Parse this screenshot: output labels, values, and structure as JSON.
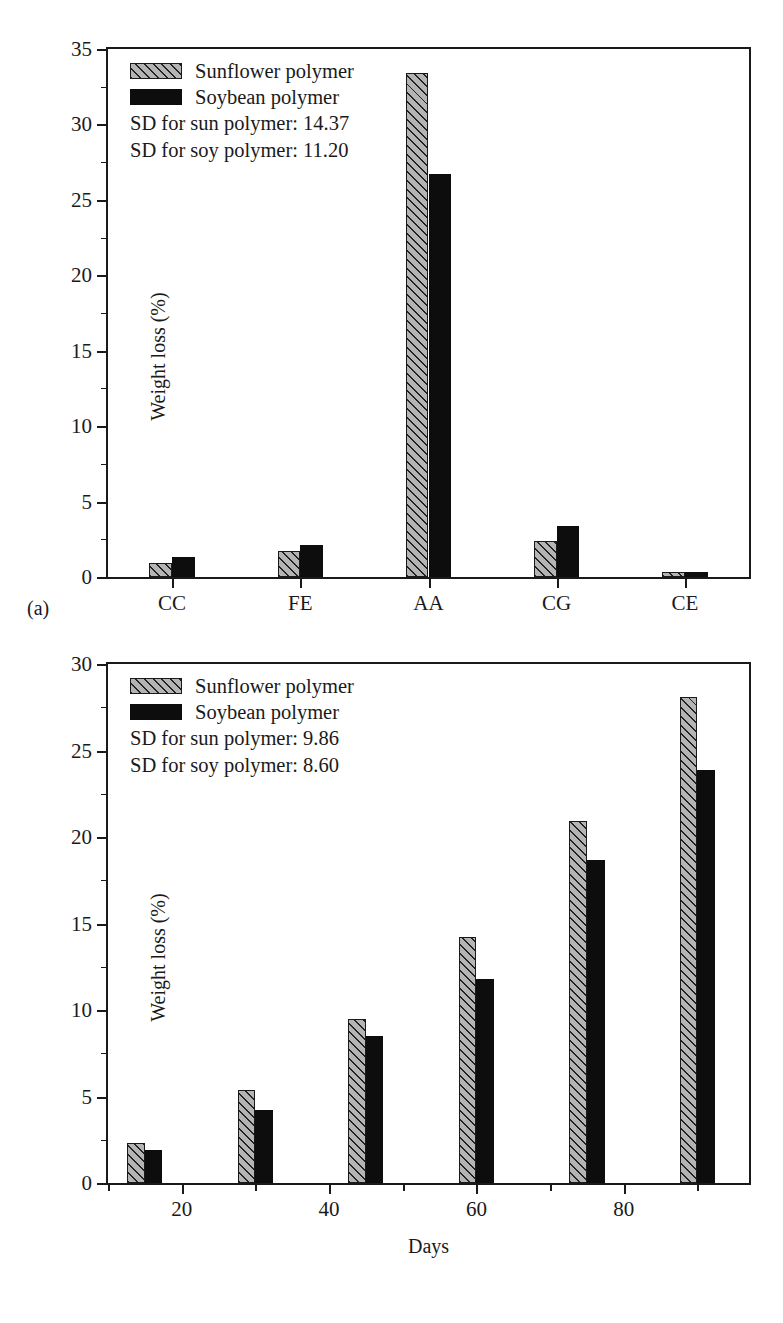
{
  "figure": {
    "panels": [
      {
        "caption": "(a)",
        "legend": {
          "series": [
            {
              "label": "Sunflower polymer",
              "pattern": "hatched-gray",
              "color": "#b4b4b4"
            },
            {
              "label": "Soybean polymer",
              "pattern": "solid-black",
              "color": "#0d0d0d"
            }
          ],
          "notes": [
            "SD for sun polymer: 14.37",
            "SD for soy polymer: 11.20"
          ]
        }
      },
      {
        "caption": "(b)",
        "legend": {
          "series": [
            {
              "label": "Sunflower polymer",
              "pattern": "hatched-gray",
              "color": "#b4b4b4"
            },
            {
              "label": "Soybean polymer",
              "pattern": "solid-black",
              "color": "#0d0d0d"
            }
          ],
          "notes": [
            "SD for sun polymer: 9.86",
            "SD for soy polymer: 8.60"
          ]
        }
      }
    ]
  },
  "chart_data": [
    {
      "type": "bar",
      "title": "",
      "xlabel": "",
      "ylabel": "Weight loss (%)",
      "categories": [
        "CC",
        "FE",
        "AA",
        "CG",
        "CE"
      ],
      "series": [
        {
          "name": "Sunflower polymer",
          "values": [
            0.95,
            1.7,
            33.4,
            2.4,
            0.35
          ]
        },
        {
          "name": "Soybean polymer",
          "values": [
            1.3,
            2.1,
            26.7,
            3.4,
            0.3
          ]
        }
      ],
      "ylim": [
        0,
        35
      ],
      "yticks": [
        0,
        5,
        10,
        15,
        20,
        25,
        30,
        35
      ],
      "yticklabels": [
        "0",
        "5",
        "10",
        "15",
        "20",
        "25",
        "30",
        "35"
      ],
      "yminorticks": [
        2.5,
        7.5,
        12.5,
        17.5,
        22.5,
        27.5,
        32.5
      ],
      "grid": false,
      "legend_position": "upper-left"
    },
    {
      "type": "bar",
      "title": "",
      "xlabel": "Days",
      "ylabel": "Weight loss (%)",
      "x": [
        15,
        30,
        45,
        60,
        75,
        90
      ],
      "series": [
        {
          "name": "Sunflower polymer",
          "values": [
            2.3,
            5.35,
            9.5,
            14.2,
            20.9,
            28.1
          ]
        },
        {
          "name": "Soybean polymer",
          "values": [
            1.9,
            4.2,
            8.5,
            11.8,
            18.7,
            23.9
          ]
        }
      ],
      "ylim": [
        0,
        30
      ],
      "yticks": [
        0,
        5,
        10,
        15,
        20,
        25,
        30
      ],
      "yticklabels": [
        "0",
        "5",
        "10",
        "15",
        "20",
        "25",
        "30"
      ],
      "yminorticks": [
        2.5,
        7.5,
        12.5,
        17.5,
        22.5,
        27.5
      ],
      "xlim": [
        10,
        97
      ],
      "xticks": [
        20,
        40,
        60,
        80
      ],
      "xticklabels": [
        "20",
        "40",
        "60",
        "80"
      ],
      "xminorticks": [
        10,
        30,
        50,
        70,
        90
      ],
      "grid": false,
      "legend_position": "upper-left"
    }
  ]
}
